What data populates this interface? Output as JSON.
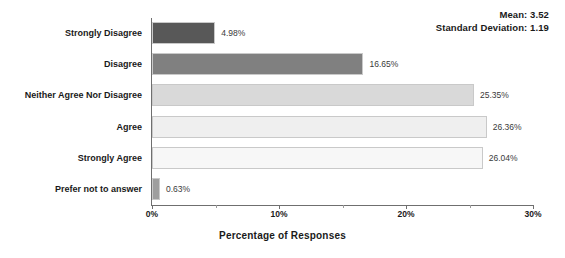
{
  "chart_data": {
    "type": "bar",
    "orientation": "horizontal",
    "title": "",
    "xlabel": "Percentage of Responses",
    "ylabel": "",
    "categories": [
      "Strongly Disagree",
      "Disagree",
      "Neither Agree Nor Disagree",
      "Agree",
      "Strongly Agree",
      "Prefer not to answer"
    ],
    "values": [
      4.98,
      16.65,
      25.35,
      26.36,
      26.04,
      0.63
    ],
    "value_labels": [
      "4.98%",
      "16.65%",
      "25.35%",
      "26.36%",
      "26.04%",
      "0.63%"
    ],
    "bar_colors": [
      "#585858",
      "#808080",
      "#d9d9d9",
      "#efefef",
      "#f7f7f7",
      "#9e9e9e"
    ],
    "xlim": [
      0,
      30
    ],
    "xticks": [
      0,
      10,
      20,
      30
    ],
    "xtick_labels": [
      "0%",
      "10%",
      "20%",
      "30%"
    ],
    "minor_xticks": [
      5,
      15,
      25
    ],
    "grid": false,
    "legend": null
  },
  "annotations": {
    "mean_label": "Mean: 3.52",
    "std_label": "Standard Deviation: 1.19"
  }
}
